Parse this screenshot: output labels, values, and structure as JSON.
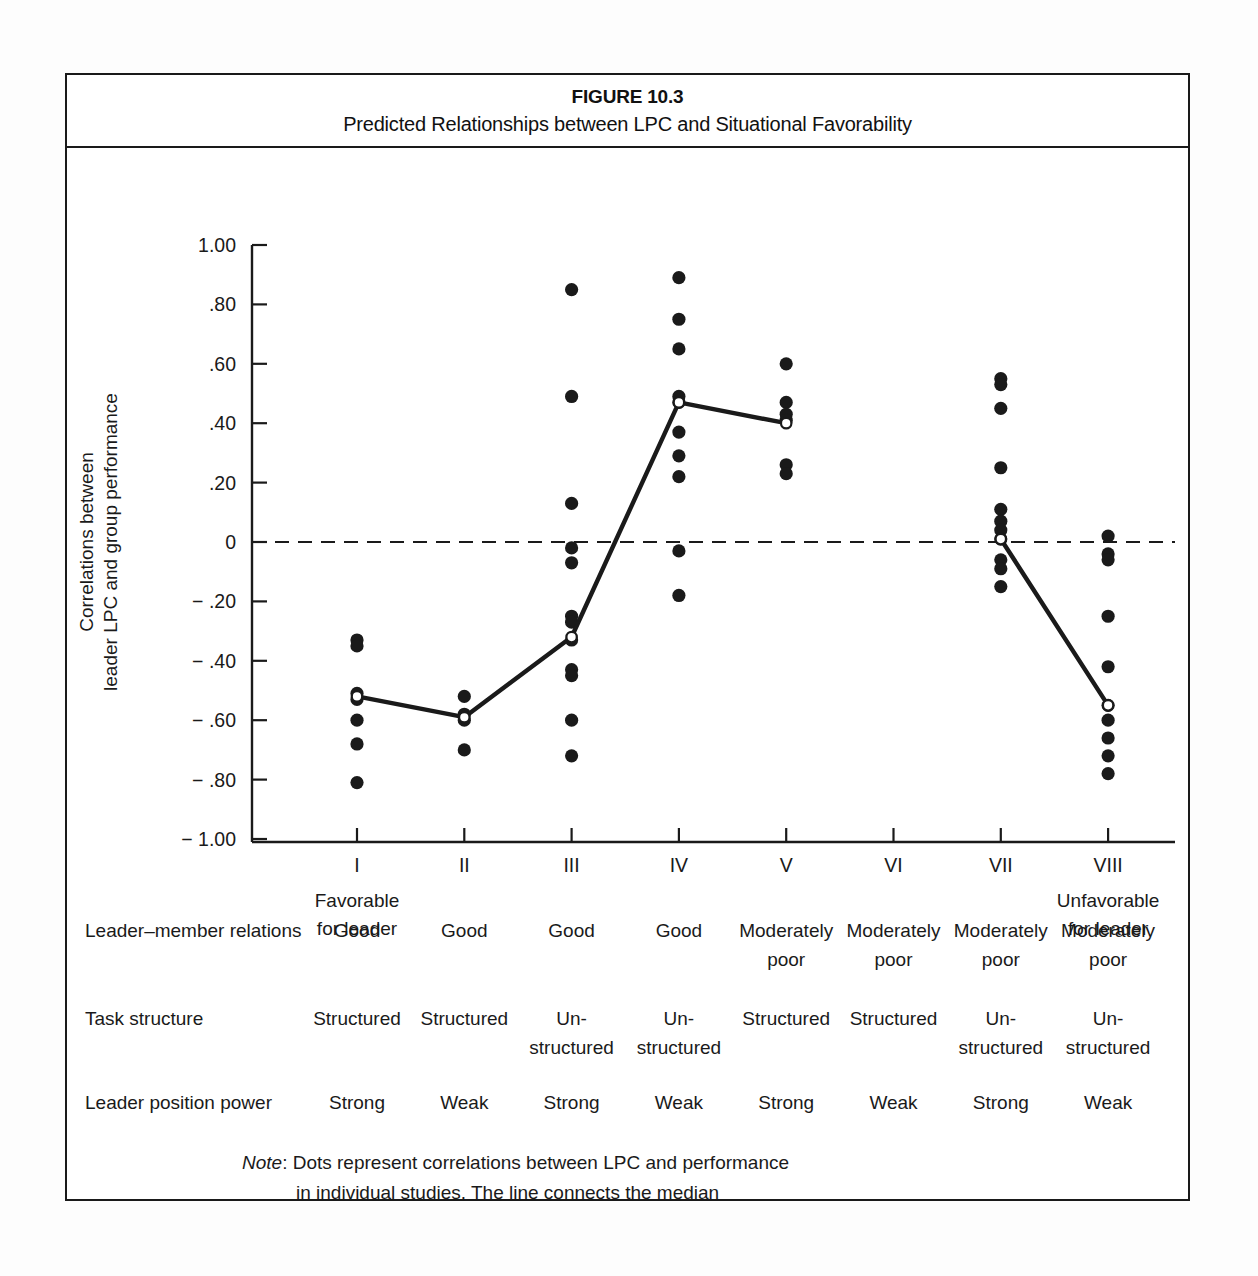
{
  "figure": {
    "number": "FIGURE 10.3",
    "title": "Predicted Relationships between LPC and Situational Favorability"
  },
  "axis": {
    "ylabel_line1": "Correlations between",
    "ylabel_line2": "leader LPC and group performance",
    "yticks": [
      "1.00",
      ".80",
      ".60",
      ".40",
      ".20",
      "0",
      "− .20",
      "− .40",
      "− .60",
      "− .80",
      "− 1.00"
    ],
    "xticks": [
      "I",
      "II",
      "III",
      "IV",
      "V",
      "VI",
      "VII",
      "VIII"
    ],
    "left_end_line1": "Favorable",
    "left_end_line2": "for leader",
    "right_end_line1": "Unfavorable",
    "right_end_line2": "for leader"
  },
  "table": {
    "rows": [
      {
        "label": "Leader–member relations",
        "values": [
          "Good",
          "Good",
          "Good",
          "Good",
          "Moderately poor",
          "Moderately poor",
          "Moderately poor",
          "Moderately poor"
        ]
      },
      {
        "label": "Task structure",
        "values": [
          "Structured",
          "Structured",
          "Un-\nstructured",
          "Un-\nstructured",
          "Structured",
          "Structured",
          "Un-\nstructured",
          "Un-\nstructured"
        ]
      },
      {
        "label": "Leader position power",
        "values": [
          "Strong",
          "Weak",
          "Strong",
          "Weak",
          "Strong",
          "Weak",
          "Strong",
          "Weak"
        ]
      }
    ]
  },
  "note": {
    "prefix": "Note",
    "colon": ":",
    "line1": "Dots represent correlations between LPC and performance",
    "line2": "in individual studies. The line connects the median",
    "line3": "correlations in the octants."
  },
  "source": {
    "label": "SOURCE:",
    "pre": "Adapted from",
    "work": "A Theory of Leadership Effectiveness",
    "post": ", by F. E. Fiedler. Copyright",
    "line2": "1967 by McGraw–Hill Book Company. Adapted by permission."
  },
  "colors": {
    "ink": "#1a1a1a",
    "paper": "#ffffff",
    "page": "#fdfdfd"
  },
  "chart_data": {
    "type": "scatter",
    "title": "Predicted Relationships between LPC and Situational Favorability",
    "xlabel": "",
    "ylabel": "Correlations between leader LPC and group performance",
    "ylim": [
      -1.0,
      1.0
    ],
    "xlim": [
      0.5,
      8.5
    ],
    "grid": false,
    "legend": "none",
    "zero_reference_line": 0,
    "categories": [
      "I",
      "II",
      "III",
      "IV",
      "V",
      "VI",
      "VII",
      "VIII"
    ],
    "series": [
      {
        "name": "Median correlation (line)",
        "x": [
          "I",
          "II",
          "III",
          "IV",
          "V",
          "VI",
          "VII",
          "VIII"
        ],
        "values": [
          -0.52,
          -0.59,
          -0.32,
          0.47,
          0.4,
          null,
          0.01,
          -0.55
        ]
      }
    ],
    "points": [
      {
        "octant": "I",
        "values": [
          -0.33,
          -0.35,
          -0.51,
          -0.53,
          -0.6,
          -0.68,
          -0.81
        ]
      },
      {
        "octant": "II",
        "values": [
          -0.52,
          -0.58,
          -0.6,
          -0.7
        ]
      },
      {
        "octant": "III",
        "values": [
          0.85,
          0.49,
          0.13,
          -0.02,
          -0.07,
          -0.25,
          -0.27,
          -0.33,
          -0.43,
          -0.45,
          -0.6,
          -0.72
        ]
      },
      {
        "octant": "IV",
        "values": [
          0.89,
          0.75,
          0.65,
          0.47,
          0.49,
          0.37,
          0.29,
          0.22,
          -0.03,
          -0.18
        ]
      },
      {
        "octant": "V",
        "values": [
          0.6,
          0.47,
          0.43,
          0.41,
          0.26,
          0.23
        ]
      },
      {
        "octant": "VI",
        "values": []
      },
      {
        "octant": "VII",
        "values": [
          0.55,
          0.53,
          0.45,
          0.25,
          0.11,
          0.07,
          0.04,
          0.01,
          -0.06,
          -0.09,
          -0.15
        ]
      },
      {
        "octant": "VIII",
        "values": [
          0.02,
          -0.04,
          -0.06,
          -0.25,
          -0.42,
          -0.55,
          -0.6,
          -0.66,
          -0.72,
          -0.78
        ]
      }
    ]
  }
}
